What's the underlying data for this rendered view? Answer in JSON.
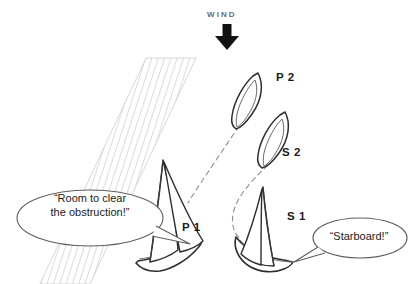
{
  "diagram": {
    "wind": {
      "label": "WIND",
      "direction": "down",
      "arrow_color": "#111111"
    },
    "obstruction": {
      "name": "hatched-obstruction-band",
      "description": "diagonal hatched band running from upper right to lower left",
      "hatch_color": "#b9b9b9",
      "edge_color": "#cfcfcf"
    },
    "boats": [
      {
        "id": "P2",
        "label": "P 2",
        "view": "plan",
        "tack": "port"
      },
      {
        "id": "S2",
        "label": "S 2",
        "view": "plan",
        "tack": "starboard"
      },
      {
        "id": "P1",
        "label": "P 1",
        "view": "perspective",
        "tack": "port"
      },
      {
        "id": "S1",
        "label": "S 1",
        "view": "perspective",
        "tack": "starboard"
      }
    ],
    "tracks": [
      {
        "name": "port-boat-track",
        "style": "dashed",
        "shape": "straight"
      },
      {
        "name": "starboard-boat-track",
        "style": "dashed",
        "shape": "curved"
      }
    ],
    "speech_bubbles": [
      {
        "name": "port-boat-hail",
        "speaker": "P1",
        "line1": "“Room to clear",
        "line2": "the obstruction!”",
        "text": "“Room to clear\nthe obstruction!”"
      },
      {
        "name": "starboard-boat-hail",
        "speaker": "S1",
        "text": "“Starboard!”"
      }
    ],
    "colors": {
      "ink": "#1a1a1a",
      "outline": "#3a3a3a",
      "muted": "#6d6d6d",
      "background": "#ffffff"
    }
  }
}
